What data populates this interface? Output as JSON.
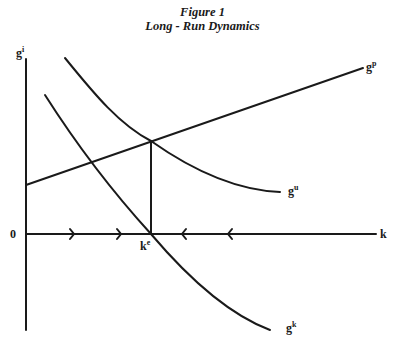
{
  "figure": {
    "title": "Figure 1",
    "subtitle": "Long - Run Dynamics"
  },
  "axes": {
    "y_label": "g",
    "y_label_sup": "i",
    "x_label": "k",
    "origin_label": "0"
  },
  "curves": [
    {
      "id": "gp",
      "label": "g",
      "sup": "p",
      "description": "upward sloping line"
    },
    {
      "id": "gu",
      "label": "g",
      "sup": "u",
      "description": "downward sloping convex curve"
    },
    {
      "id": "gk",
      "label": "g",
      "sup": "k",
      "description": "downward sloping curve crossing k axis at k^e"
    }
  ],
  "equilibrium": {
    "label": "k",
    "sup": "e"
  },
  "arrows": {
    "left_of_equilibrium": "right-pointing (2)",
    "right_of_equilibrium": "left-pointing (2)"
  },
  "colors": {
    "ink": "#1a1a1a",
    "background": "#ffffff"
  }
}
